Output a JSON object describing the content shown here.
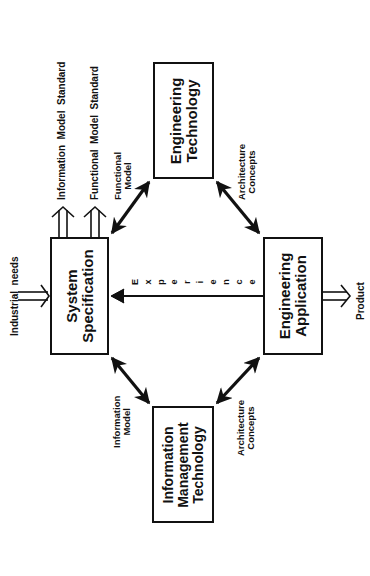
{
  "diagram": {
    "boxes": {
      "system_specification": {
        "label": "System\nSpecification"
      },
      "engineering_technology": {
        "label": "Engineering\nTechnology"
      },
      "engineering_application": {
        "label": "Engineering\nApplication"
      },
      "information_management_technology": {
        "label": "Information\nManagement\nTechnology"
      }
    },
    "inputs": {
      "industrial_needs": "Industrial  needs"
    },
    "outputs": {
      "information_model_standard": "Information  Model  Standard",
      "functional_model_standard": "Functional  Model  Standard",
      "product": "Product"
    },
    "connections": {
      "functional_model": "Functional\nModel",
      "architecture_concepts_top": "Architecture\nConcepts",
      "information_model": "Information\nModel",
      "architecture_concepts_bottom": "Architecture\nConcepts"
    },
    "experience": {
      "letters": [
        "E",
        "x",
        "p",
        "e",
        "r",
        "i",
        "e",
        "n",
        "c",
        "e"
      ]
    },
    "colors": {
      "stroke": "#111111",
      "background": "#ffffff"
    }
  }
}
